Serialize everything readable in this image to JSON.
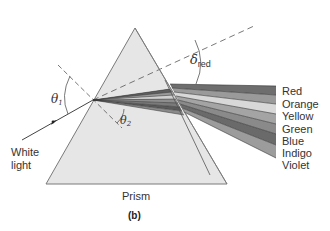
{
  "figure": {
    "caption": "(b)",
    "prism_label": "Prism",
    "incident_label_line1": "White",
    "incident_label_line2": "light",
    "theta1_symbol": "θ",
    "theta1_sub": "1",
    "theta2_symbol": "θ",
    "theta2_sub": "2",
    "delta_symbol": "δ",
    "delta_sub": "red",
    "spectrum": [
      {
        "name": "Red",
        "color": "#6e6e6e"
      },
      {
        "name": "Orange",
        "color": "#9a9a9a"
      },
      {
        "name": "Yellow",
        "color": "#d8d8d8"
      },
      {
        "name": "Green",
        "color": "#a4a4a4"
      },
      {
        "name": "Blue",
        "color": "#8a8a8a"
      },
      {
        "name": "Indigo",
        "color": "#6a6a6a"
      },
      {
        "name": "Violet",
        "color": "#9c9c9c"
      }
    ],
    "colors": {
      "prism_fill": "#e6e6e6",
      "prism_stroke": "#7a7a7a",
      "line": "#555555"
    }
  }
}
